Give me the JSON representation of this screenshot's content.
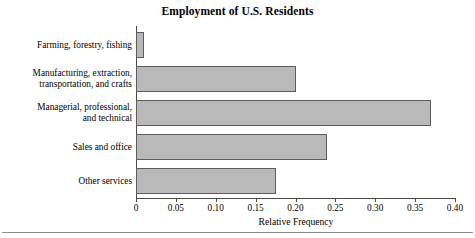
{
  "chart_data": {
    "type": "bar",
    "orientation": "horizontal",
    "title": "Employment of U.S. Residents",
    "xlabel": "Relative Frequency",
    "ylabel": "",
    "categories": [
      "Farming, forestry, fishing",
      "Manufacturing, extraction, transportation, and crafts",
      "Managerial, professional, and technical",
      "Sales and office",
      "Other services"
    ],
    "values": [
      0.01,
      0.2,
      0.37,
      0.24,
      0.175
    ],
    "xlim": [
      0,
      0.4
    ],
    "xticks": [
      0,
      0.05,
      0.1,
      0.15,
      0.2,
      0.25,
      0.3,
      0.35,
      0.4
    ],
    "xtick_labels": [
      "0",
      "0.05",
      "0.10",
      "0.15",
      "0.20",
      "0.25",
      "0.30",
      "0.35",
      "0.40"
    ],
    "grid": false,
    "legend": null,
    "bar_fill_color": "#b9b9b9",
    "bar_border_color": "#5d5d5d",
    "axis_color": "#4a4a4a"
  },
  "category_label_lines": [
    [
      "Farming, forestry, fishing"
    ],
    [
      "Manufacturing, extraction,",
      "transportation, and crafts"
    ],
    [
      "Managerial, professional,",
      "and technical"
    ],
    [
      "Sales and office"
    ],
    [
      "Other services"
    ]
  ]
}
